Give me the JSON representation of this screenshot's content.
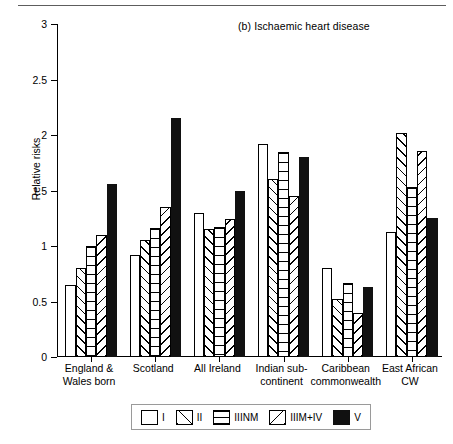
{
  "figure": {
    "panel_caption": "(b) Ischaemic heart disease",
    "ylabel": "Relative risks"
  },
  "legend": {
    "items": [
      {
        "key": "I",
        "label": "I",
        "pattern": "plain"
      },
      {
        "key": "II",
        "label": "II",
        "pattern": "forward-diagonal"
      },
      {
        "key": "IIINM",
        "label": "IIINM",
        "pattern": "horizontal-lines"
      },
      {
        "key": "IIIM+IV",
        "label": "IIIM+IV",
        "pattern": "backward-diagonal"
      },
      {
        "key": "V",
        "label": "V",
        "pattern": "solid-black"
      }
    ]
  },
  "chart_data": {
    "type": "bar",
    "title": "(b) Ischaemic heart disease",
    "xlabel": "",
    "ylabel": "Relative risks",
    "ylim": [
      0,
      3
    ],
    "yticks": [
      "0",
      "0.5",
      "1",
      "1.5",
      "2",
      "2.5",
      "3"
    ],
    "ytick_values": [
      0,
      0.5,
      1,
      1.5,
      2,
      2.5,
      3
    ],
    "grid": false,
    "legend_position": "bottom",
    "categories": [
      "England &\nWales born",
      "Scotland",
      "All Ireland",
      "Indian sub-\ncontinent",
      "Caribbean\ncommonwealth",
      "East African\nCW"
    ],
    "series": [
      {
        "name": "I",
        "pattern": "plain",
        "values": [
          0.65,
          0.92,
          1.3,
          1.92,
          0.8,
          1.13
        ]
      },
      {
        "name": "II",
        "pattern": "forward-diagonal",
        "values": [
          0.8,
          1.05,
          1.15,
          1.6,
          0.52,
          2.02
        ]
      },
      {
        "name": "IIINM",
        "pattern": "horizontal-lines",
        "values": [
          1.0,
          1.16,
          1.17,
          1.85,
          0.67,
          1.53
        ]
      },
      {
        "name": "IIIM+IV",
        "pattern": "backward-diagonal",
        "values": [
          1.1,
          1.35,
          1.24,
          1.45,
          0.4,
          1.86
        ]
      },
      {
        "name": "V",
        "pattern": "solid-black",
        "values": [
          1.56,
          2.15,
          1.5,
          1.8,
          0.63,
          1.25
        ]
      }
    ]
  }
}
